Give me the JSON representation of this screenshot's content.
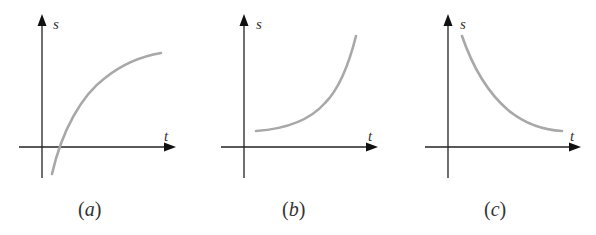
{
  "figure": {
    "panels": [
      {
        "id": "a",
        "caption": "(a)",
        "caption_letter": "a",
        "y_label": "s",
        "x_label": "t",
        "description": "Increasing concave curve starting below the t-axis and leveling off"
      },
      {
        "id": "b",
        "caption": "(b)",
        "caption_letter": "b",
        "y_label": "s",
        "x_label": "t",
        "description": "Increasing convex curve starting above the t-axis"
      },
      {
        "id": "c",
        "caption": "(c)",
        "caption_letter": "c",
        "y_label": "s",
        "x_label": "t",
        "description": "Decreasing convex curve approaching the t-axis"
      }
    ],
    "colors": {
      "axis": "#222222",
      "curve": "#a8a8a8",
      "text": "#333333"
    }
  }
}
